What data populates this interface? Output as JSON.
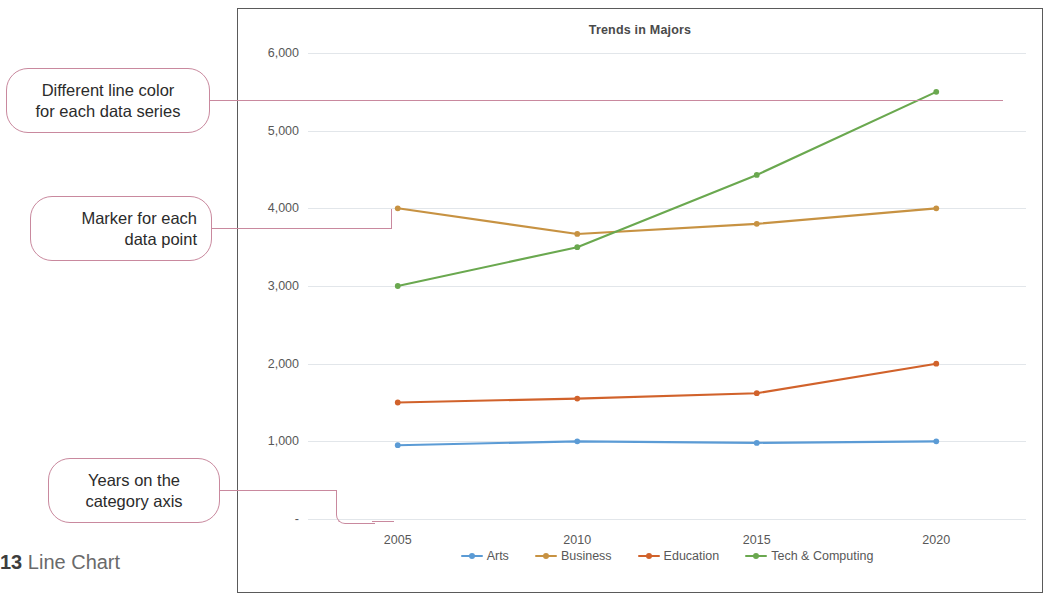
{
  "caption": {
    "number": "13",
    "text": "Line Chart"
  },
  "callouts": [
    {
      "id": "line-color",
      "text_line1": "Different line color",
      "text_line2": "for each data series",
      "align": "center"
    },
    {
      "id": "marker",
      "text_line1": "Marker for each",
      "text_line2": "data point",
      "align": "right"
    },
    {
      "id": "category-axis",
      "text_line1": "Years on the",
      "text_line2": "category axis",
      "align": "center"
    }
  ],
  "chart_data": {
    "type": "line",
    "title": "Trends in Majors",
    "xlabel": "",
    "ylabel": "",
    "categories": [
      "2005",
      "2010",
      "2015",
      "2020"
    ],
    "ylim": [
      0,
      6000
    ],
    "yticks": [
      "-",
      "1,000",
      "2,000",
      "3,000",
      "4,000",
      "5,000",
      "6,000"
    ],
    "ytick_values": [
      0,
      1000,
      2000,
      3000,
      4000,
      5000,
      6000
    ],
    "grid": true,
    "legend_position": "bottom",
    "markers": true,
    "series": [
      {
        "name": "Arts",
        "color": "#5b9bd5",
        "values": [
          950,
          1000,
          980,
          1000
        ]
      },
      {
        "name": "Business",
        "color": "#c79242",
        "values": [
          4000,
          3670,
          3800,
          4000
        ]
      },
      {
        "name": "Education",
        "color": "#d1622b",
        "values": [
          1500,
          1550,
          1620,
          2000
        ]
      },
      {
        "name": "Tech & Computing",
        "color": "#6aa84f",
        "values": [
          3000,
          3500,
          4430,
          5500
        ]
      }
    ]
  }
}
